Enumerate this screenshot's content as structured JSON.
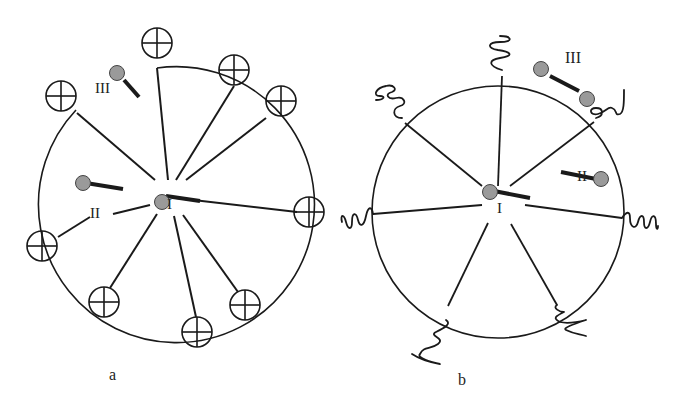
{
  "colors": {
    "line": "#1a1a1a",
    "particle": "#9a9a9a",
    "background": "#ffffff"
  },
  "panel_a": {
    "caption": "a",
    "center_label": "I",
    "site_labels": {
      "I": "I",
      "II": "II",
      "III": "III"
    },
    "end_group_icon": "circled-plus-icon",
    "end_group_count": 10,
    "description": "Star polymer with charged (circled-plus) chain ends; surfactant/particle species I at core, II inside corona, III outside"
  },
  "panel_b": {
    "caption": "b",
    "center_label": "I",
    "site_labels": {
      "I": "I",
      "II": "II",
      "III": "III"
    },
    "end_group_icon": "coil-icon",
    "end_group_count": 7,
    "description": "Star polymer with coiled chain ends; species I at core, II inside corona, III dumbbell at periphery"
  }
}
